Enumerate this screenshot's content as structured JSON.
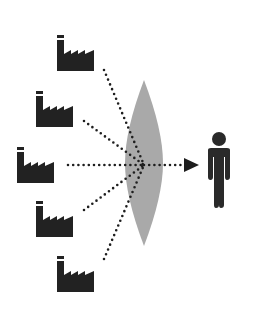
{
  "diagram": {
    "title": "Multiple pollution sources converging through a lens onto a person",
    "colors": {
      "icon": "#222222",
      "lens": "#a9a9a9",
      "dots": "#1e1e1e",
      "background": "#ffffff"
    },
    "sources": [
      {
        "id": "factory-1",
        "icon": "factory-icon",
        "x": 57,
        "y": 35,
        "line_start": [
          104,
          70
        ]
      },
      {
        "id": "factory-2",
        "icon": "factory-icon",
        "x": 36,
        "y": 91,
        "line_start": [
          84,
          121
        ]
      },
      {
        "id": "factory-3",
        "icon": "factory-icon",
        "x": 17,
        "y": 147,
        "line_start": [
          68,
          165
        ]
      },
      {
        "id": "factory-4",
        "icon": "factory-icon",
        "x": 36,
        "y": 201,
        "line_start": [
          84,
          210
        ]
      },
      {
        "id": "factory-5",
        "icon": "factory-icon",
        "x": 57,
        "y": 256,
        "line_start": [
          104,
          259
        ]
      }
    ],
    "focus_point": [
      144,
      165
    ],
    "lens": {
      "icon": "lens-shape",
      "cx": 144,
      "top": 80,
      "bottom": 246,
      "half_width": 19
    },
    "arrow": {
      "icon": "arrow-right-icon",
      "from": [
        144,
        165
      ],
      "to": [
        198,
        165
      ]
    },
    "target": {
      "icon": "person-icon",
      "x": 205,
      "y": 132
    }
  }
}
